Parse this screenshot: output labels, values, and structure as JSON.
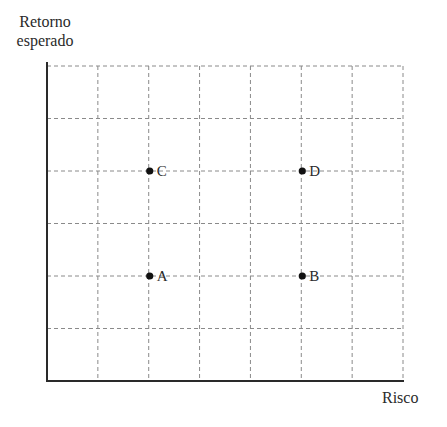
{
  "chart_data": {
    "type": "scatter",
    "title": "",
    "xlabel": "Risco",
    "ylabel_lines": [
      "Retorno",
      "esperado"
    ],
    "grid": true,
    "grid_style": "dashed",
    "x_gridlines": 7,
    "y_gridlines": 6,
    "xlim": [
      0,
      7
    ],
    "ylim": [
      0,
      6
    ],
    "ticks_labeled": false,
    "points": [
      {
        "label": "A",
        "x": 2,
        "y": 2
      },
      {
        "label": "B",
        "x": 5,
        "y": 2
      },
      {
        "label": "C",
        "x": 2,
        "y": 4
      },
      {
        "label": "D",
        "x": 5,
        "y": 4
      }
    ]
  },
  "colors": {
    "axis": "#2a2a2a",
    "grid": "#8a8a8a",
    "point": "#111111",
    "text": "#2a2a2a"
  }
}
